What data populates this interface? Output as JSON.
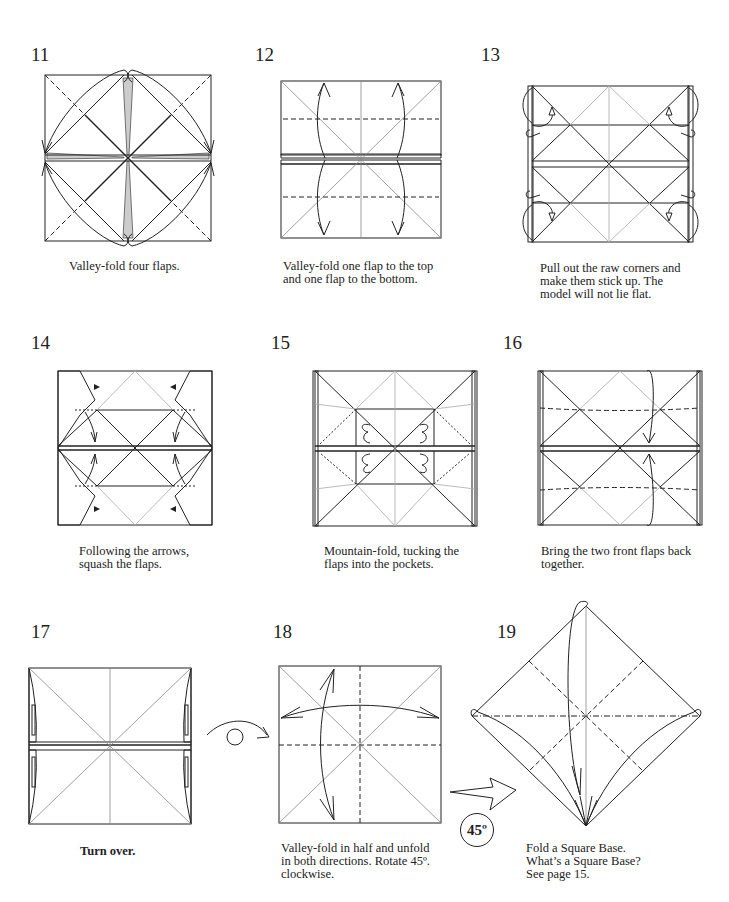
{
  "steps": [
    {
      "number": "11",
      "caption": "Valley-fold four flaps."
    },
    {
      "number": "12",
      "caption": "Valley-fold one flap to the top\nand one flap to the bottom."
    },
    {
      "number": "13",
      "caption": "Pull out the raw corners and\nmake them stick up.  The\nmodel will not lie flat."
    },
    {
      "number": "14",
      "caption": "Following the arrows,\nsquash the flaps."
    },
    {
      "number": "15",
      "caption": "Mountain-fold, tucking the\nflaps into the pockets."
    },
    {
      "number": "16",
      "caption": "Bring the two front flaps back\ntogether."
    },
    {
      "number": "17",
      "caption": "Turn over."
    },
    {
      "number": "18",
      "caption": "Valley-fold in half and unfold\nin both directions.  Rotate 45º.\nclockwise."
    },
    {
      "number": "19",
      "caption": "Fold a Square Base.\nWhat’s a Square Base?\nSee page 15."
    }
  ],
  "symbols": {
    "rotate_label": "45º"
  },
  "colors": {
    "paper_colored": "#d9d9d9",
    "paper_white": "#ffffff",
    "line": "#222222"
  }
}
